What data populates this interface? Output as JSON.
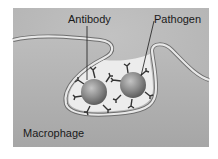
{
  "figure": {
    "type": "biology-diagram",
    "labels": {
      "antibody": "Antibody",
      "pathogen": "Pathogen",
      "macrophage": "Macrophage"
    },
    "colors": {
      "background": "#ffffff",
      "extracellular": "#b9b9b9",
      "cytoplasm": "#a9a9a9",
      "membrane_fill": "#e6e6e6",
      "membrane_edge": "#6e6e6e",
      "vacuole": "#ececec",
      "pathogen": "#8c8c8c",
      "antibody": "#333333"
    }
  }
}
